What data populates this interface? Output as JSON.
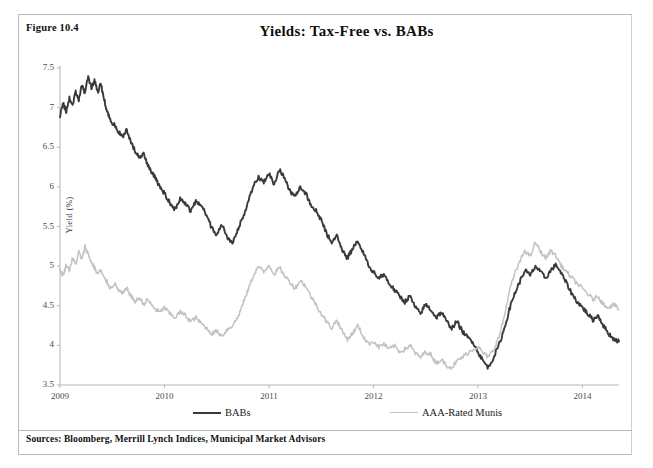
{
  "figure": {
    "number_label": "Figure 10.4",
    "title": "Yields: Tax-Free vs. BABs",
    "sources": "Sources: Bloomberg, Merrill Lynch Indices, Municipal Market Advisors"
  },
  "legend": {
    "position": "bottom",
    "items": [
      {
        "label": "BABs",
        "color": "#3a3a3a"
      },
      {
        "label": "AAA-Rated Munis",
        "color": "#c2c2c2"
      }
    ]
  },
  "axes": {
    "y_title": "Yield (%)",
    "y_ticks": [
      "3.5",
      "4",
      "4.5",
      "5",
      "5.5",
      "6",
      "6.5",
      "7",
      "7.5"
    ],
    "x_ticks": [
      "2009",
      "2010",
      "2011",
      "2012",
      "2013",
      "2014"
    ]
  },
  "chart_data": {
    "type": "line",
    "title": "Yields: Tax-Free vs. BABs",
    "xlabel": "",
    "ylabel": "Yield (%)",
    "ylim": [
      3.5,
      7.5
    ],
    "xlim": [
      2009.0,
      2014.35
    ],
    "y_ticks": [
      3.5,
      4,
      4.5,
      5,
      5.5,
      6,
      6.5,
      7,
      7.5
    ],
    "x_ticks": [
      2009,
      2010,
      2011,
      2012,
      2013,
      2014
    ],
    "grid": false,
    "legend_position": "bottom",
    "x": [
      2009.0,
      2009.03,
      2009.06,
      2009.09,
      2009.12,
      2009.15,
      2009.18,
      2009.21,
      2009.24,
      2009.27,
      2009.3,
      2009.33,
      2009.36,
      2009.39,
      2009.42,
      2009.45,
      2009.48,
      2009.52,
      2009.56,
      2009.6,
      2009.64,
      2009.68,
      2009.72,
      2009.76,
      2009.8,
      2009.84,
      2009.88,
      2009.92,
      2009.96,
      2010.0,
      2010.05,
      2010.1,
      2010.15,
      2010.2,
      2010.25,
      2010.3,
      2010.35,
      2010.4,
      2010.45,
      2010.5,
      2010.55,
      2010.6,
      2010.65,
      2010.7,
      2010.75,
      2010.8,
      2010.85,
      2010.9,
      2010.95,
      2011.0,
      2011.05,
      2011.1,
      2011.15,
      2011.2,
      2011.25,
      2011.3,
      2011.35,
      2011.4,
      2011.45,
      2011.5,
      2011.55,
      2011.6,
      2011.65,
      2011.7,
      2011.75,
      2011.8,
      2011.85,
      2011.9,
      2011.95,
      2012.0,
      2012.05,
      2012.1,
      2012.15,
      2012.2,
      2012.25,
      2012.3,
      2012.35,
      2012.4,
      2012.45,
      2012.5,
      2012.55,
      2012.6,
      2012.65,
      2012.7,
      2012.75,
      2012.8,
      2012.85,
      2012.9,
      2012.95,
      2013.0,
      2013.05,
      2013.1,
      2013.15,
      2013.2,
      2013.25,
      2013.3,
      2013.35,
      2013.4,
      2013.45,
      2013.5,
      2013.55,
      2013.6,
      2013.65,
      2013.7,
      2013.75,
      2013.8,
      2013.85,
      2013.9,
      2013.95,
      2014.0,
      2014.05,
      2014.1,
      2014.15,
      2014.2,
      2014.25,
      2014.3,
      2014.35
    ],
    "series": [
      {
        "name": "BABs",
        "color": "#3a3a3a",
        "values": [
          6.9,
          7.05,
          6.95,
          7.12,
          7.02,
          7.2,
          7.1,
          7.28,
          7.18,
          7.4,
          7.25,
          7.35,
          7.2,
          7.3,
          7.12,
          6.95,
          6.85,
          6.78,
          6.7,
          6.62,
          6.72,
          6.55,
          6.45,
          6.38,
          6.42,
          6.28,
          6.18,
          6.1,
          5.98,
          5.92,
          5.8,
          5.72,
          5.85,
          5.78,
          5.7,
          5.82,
          5.76,
          5.66,
          5.48,
          5.4,
          5.52,
          5.35,
          5.3,
          5.45,
          5.62,
          5.8,
          6.02,
          6.12,
          6.05,
          6.18,
          6.02,
          6.22,
          6.1,
          5.95,
          5.88,
          6.0,
          5.92,
          5.78,
          5.7,
          5.58,
          5.42,
          5.3,
          5.38,
          5.2,
          5.1,
          5.22,
          5.32,
          5.18,
          5.02,
          4.92,
          4.85,
          4.9,
          4.78,
          4.7,
          4.62,
          4.55,
          4.62,
          4.48,
          4.4,
          4.52,
          4.45,
          4.35,
          4.42,
          4.3,
          4.22,
          4.3,
          4.18,
          4.1,
          4.05,
          3.92,
          3.8,
          3.72,
          3.85,
          4.0,
          4.2,
          4.45,
          4.65,
          4.8,
          4.95,
          4.88,
          5.0,
          4.92,
          4.85,
          4.95,
          5.02,
          4.9,
          4.78,
          4.65,
          4.55,
          4.48,
          4.4,
          4.32,
          4.38,
          4.25,
          4.15,
          4.08,
          4.05
        ]
      },
      {
        "name": "AAA-Rated Munis",
        "color": "#c2c2c2",
        "values": [
          4.95,
          4.88,
          5.02,
          4.95,
          5.1,
          5.02,
          5.18,
          5.08,
          5.25,
          5.15,
          5.05,
          4.98,
          4.9,
          4.95,
          4.85,
          4.8,
          4.72,
          4.78,
          4.7,
          4.65,
          4.72,
          4.62,
          4.55,
          4.6,
          4.52,
          4.58,
          4.5,
          4.45,
          4.42,
          4.48,
          4.4,
          4.35,
          4.42,
          4.38,
          4.3,
          4.35,
          4.28,
          4.22,
          4.15,
          4.18,
          4.12,
          4.2,
          4.25,
          4.35,
          4.52,
          4.7,
          4.88,
          5.0,
          4.92,
          5.02,
          4.9,
          4.98,
          4.88,
          4.8,
          4.72,
          4.82,
          4.75,
          4.62,
          4.52,
          4.4,
          4.3,
          4.22,
          4.32,
          4.18,
          4.08,
          4.15,
          4.25,
          4.12,
          4.02,
          4.05,
          3.98,
          4.02,
          3.95,
          4.0,
          3.92,
          3.95,
          4.0,
          3.9,
          3.85,
          3.92,
          3.88,
          3.78,
          3.82,
          3.75,
          3.72,
          3.8,
          3.85,
          3.9,
          3.95,
          3.98,
          3.9,
          3.85,
          3.95,
          4.1,
          4.35,
          4.68,
          4.9,
          5.05,
          5.2,
          5.12,
          5.3,
          5.18,
          5.1,
          5.2,
          5.12,
          5.0,
          4.92,
          4.85,
          4.78,
          4.72,
          4.65,
          4.58,
          4.62,
          4.52,
          4.48,
          4.52,
          4.45
        ]
      }
    ]
  }
}
